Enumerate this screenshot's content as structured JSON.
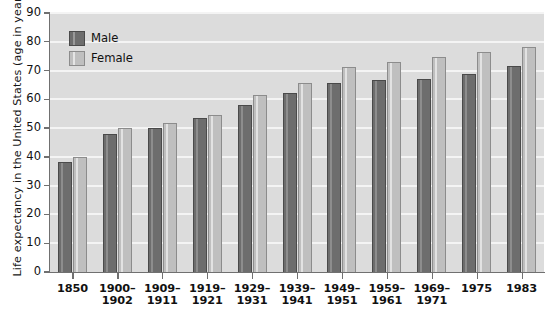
{
  "chart_data": {
    "type": "bar",
    "title": "",
    "xlabel": "",
    "ylabel": "Life expectancy in the United States (age in years)",
    "ylim": [
      0,
      90
    ],
    "yticks": [
      0,
      10,
      20,
      30,
      40,
      50,
      60,
      70,
      80,
      90
    ],
    "ytick_labels": [
      "0",
      "10",
      "20",
      "30",
      "40",
      "50",
      "60",
      "70",
      "80",
      "90"
    ],
    "grid": true,
    "legend_position": "upper left",
    "categories": [
      "1850",
      "1900–\n1902",
      "1909–\n1911",
      "1919–\n1921",
      "1929–\n1931",
      "1939–\n1941",
      "1949–\n1951",
      "1959–\n1961",
      "1969–\n1971",
      "1975",
      "1983"
    ],
    "category_lines": [
      {
        "line1": "1850",
        "line2": ""
      },
      {
        "line1": "1900–",
        "line2": "1902"
      },
      {
        "line1": "1909–",
        "line2": "1911"
      },
      {
        "line1": "1919–",
        "line2": "1921"
      },
      {
        "line1": "1929–",
        "line2": "1931"
      },
      {
        "line1": "1939–",
        "line2": "1941"
      },
      {
        "line1": "1949–",
        "line2": "1951"
      },
      {
        "line1": "1959–",
        "line2": "1961"
      },
      {
        "line1": "1969–",
        "line2": "1971"
      },
      {
        "line1": "1975",
        "line2": ""
      },
      {
        "line1": "1983",
        "line2": ""
      }
    ],
    "series": [
      {
        "name": "Male",
        "color": "#6d6d6d",
        "values": [
          38.3,
          47.9,
          49.9,
          53.5,
          58.1,
          62.1,
          65.6,
          66.6,
          67.1,
          68.8,
          71.5
        ]
      },
      {
        "name": "Female",
        "color": "#bfbfbf",
        "values": [
          40.0,
          50.2,
          51.8,
          54.6,
          61.6,
          65.6,
          71.1,
          73.1,
          74.8,
          76.6,
          78.3
        ]
      }
    ]
  },
  "legend": {
    "items": [
      {
        "label": "Male",
        "key": "male"
      },
      {
        "label": "Female",
        "key": "female"
      }
    ]
  },
  "colors": {
    "plot_background": "#dcdcdc",
    "gridline": "#f4f4f4",
    "axis": "#707070",
    "male_bar": "#6d6d6d",
    "male_bar_edge": "#4a4a4a",
    "female_bar": "#bfbfbf",
    "female_bar_edge": "#8c8c8c",
    "text": "#111111"
  }
}
